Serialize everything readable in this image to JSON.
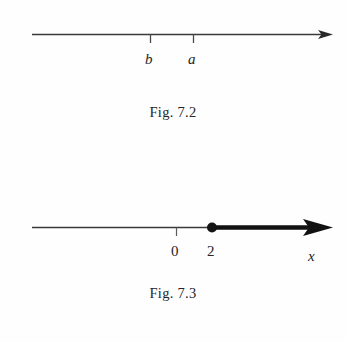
{
  "page": {
    "background_color": "#fefefe",
    "ink_color": "#1c1c1c"
  },
  "figures": [
    {
      "id": "fig-7-2",
      "caption": "Fig. 7.2",
      "type": "number-line",
      "line_style": "thin",
      "arrow": "right",
      "arrow_style": "small",
      "ticks": [
        {
          "label": "b",
          "italic": true,
          "position": 150
        },
        {
          "label": "a",
          "italic": true,
          "position": 193
        }
      ],
      "axis_label": "",
      "highlighted_ray": null,
      "point_marker": null
    },
    {
      "id": "fig-7-3",
      "caption": "Fig. 7.3",
      "type": "number-line",
      "line_style": "thin-with-bold-ray",
      "arrow": "right",
      "arrow_style": "large",
      "ticks": [
        {
          "label": "0",
          "italic": false,
          "position": 176
        },
        {
          "label": "2",
          "italic": false,
          "position": 212
        }
      ],
      "axis_label": "x",
      "highlighted_ray": {
        "from_label": "2",
        "direction": "right",
        "inclusive": true,
        "style": "bold"
      },
      "point_marker": {
        "label": "2",
        "fill": "solid",
        "color": "#141414"
      }
    }
  ],
  "colors": {
    "line_thin": "#3a3a3a",
    "line_bold": "#111111",
    "text": "#242424"
  }
}
